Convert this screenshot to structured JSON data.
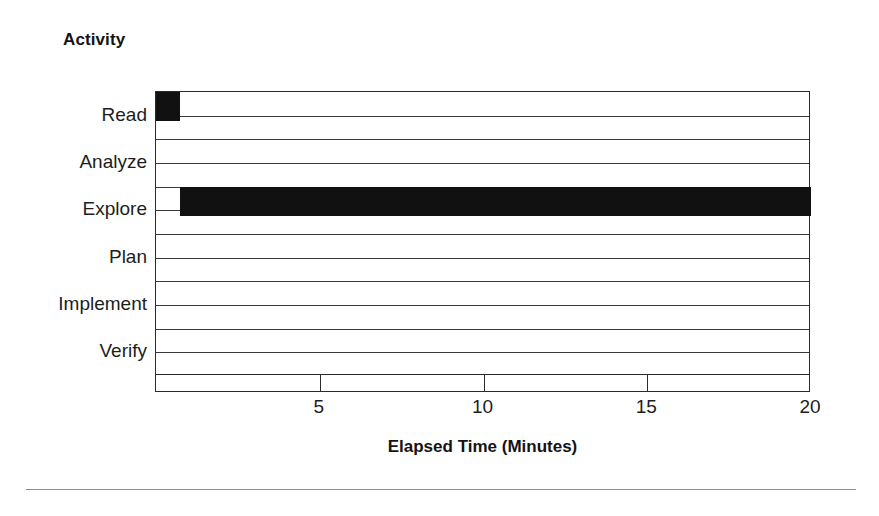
{
  "figure": {
    "yaxis_group_title": "Activity",
    "bottom_rule": "horizontal-rule"
  },
  "chart_data": {
    "type": "bar",
    "orientation": "horizontal",
    "title": "",
    "subtitle": "",
    "xlabel": "Elapsed Time (Minutes)",
    "ylabel": "Activity",
    "categories": [
      "Read",
      "Analyze",
      "Explore",
      "Plan",
      "Implement",
      "Verify"
    ],
    "xlim": [
      0,
      20
    ],
    "xticks": [
      5,
      10,
      15,
      20
    ],
    "xtick_labels": [
      "5",
      "10",
      "15",
      "20"
    ],
    "grid": true,
    "grid_axis": "y",
    "legend": false,
    "legend_position": "none",
    "bar_color": "#111111",
    "series": [
      {
        "name": "Elapsed Time",
        "type": "range",
        "bars": [
          {
            "category": "Read",
            "start": 0.0,
            "end": 0.72,
            "value": 0.72
          },
          {
            "category": "Analyze",
            "start": 0.0,
            "end": 0.0,
            "value": 0.0
          },
          {
            "category": "Explore",
            "start": 0.72,
            "end": 20.0,
            "value": 19.28
          },
          {
            "category": "Plan",
            "start": 0.0,
            "end": 0.0,
            "value": 0.0
          },
          {
            "category": "Implement",
            "start": 0.0,
            "end": 0.0,
            "value": 0.0
          },
          {
            "category": "Verify",
            "start": 0.0,
            "end": 0.0,
            "value": 0.0
          }
        ]
      }
    ],
    "values": [
      0.72,
      0,
      19.28,
      0,
      0,
      0
    ]
  },
  "geometry": {
    "plot_left": 155,
    "plot_top": 91,
    "plot_width": 655,
    "plot_height": 284,
    "rows": 12,
    "row_height": 23.667,
    "px_per_unit": 32.75
  }
}
